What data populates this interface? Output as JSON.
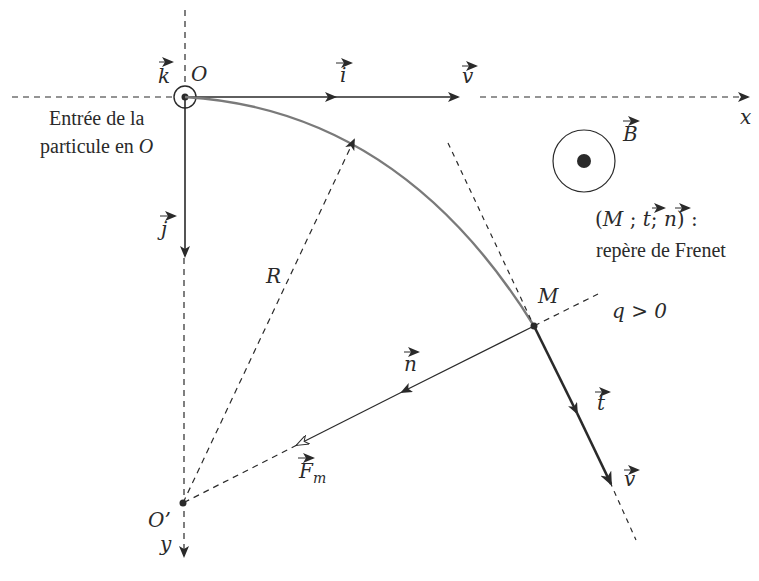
{
  "diagram": {
    "points": {
      "origin": {
        "label": "O",
        "x": 185,
        "y": 97
      },
      "center": {
        "label": "O’",
        "x": 183,
        "y": 503
      },
      "particle": {
        "label": "M",
        "x": 534,
        "y": 326
      }
    },
    "axes": {
      "x_label": "x",
      "y_label": "y"
    },
    "vectors": {
      "k": "k",
      "i": "i",
      "j": "j",
      "v_top": "v",
      "B": "B",
      "n": "n",
      "t": "t",
      "v_bottom": "v",
      "Fm_main": "F",
      "Fm_sub": "m"
    },
    "labels": {
      "entry_line1": "Entrée de la",
      "entry_line2_prefix": "particule en ",
      "entry_line2_point": "O",
      "radius": "R",
      "charge": "q > 0",
      "frenet_line1_open": "(",
      "frenet_M": "M",
      "frenet_sep1": " ; ",
      "frenet_t": "t",
      "frenet_sep2": "; ",
      "frenet_n": "n",
      "frenet_close": ") :",
      "frenet_line2": "repère de Frenet"
    },
    "colors": {
      "ink": "#2a2a2a",
      "trajectory": "#7a7a7a",
      "background": "#ffffff"
    }
  }
}
